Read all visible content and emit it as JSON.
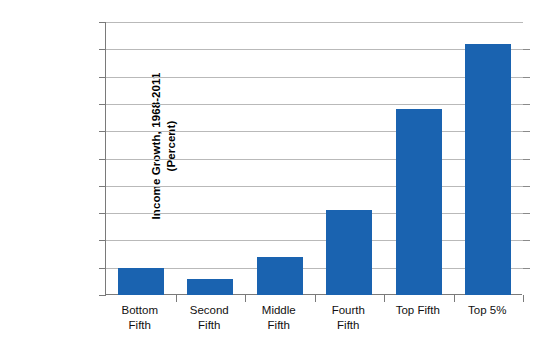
{
  "chart_data": {
    "type": "bar",
    "title": "",
    "subtitle": "",
    "xlabel": "",
    "ylabel": "Income Growth, 1968-2011 (Percent)",
    "ylabel_lines": [
      "Income Growth, 1968-2011",
      "(Percent)"
    ],
    "categories": [
      "Bottom Fifth",
      "Second Fifth",
      "Middle Fifth",
      "Fourth Fifth",
      "Top Fifth",
      "Top 5%"
    ],
    "category_lines": [
      [
        "Bottom",
        "Fifth"
      ],
      [
        "Second",
        "Fifth"
      ],
      [
        "Middle",
        "Fifth"
      ],
      [
        "Fourth",
        "Fifth"
      ],
      [
        "Top Fifth",
        ""
      ],
      [
        "Top 5%",
        ""
      ]
    ],
    "values": [
      10,
      6,
      14,
      31,
      68,
      92
    ],
    "ylim": [
      0,
      100
    ],
    "ytick_values": [
      0,
      10,
      20,
      30,
      40,
      50,
      60,
      70,
      80,
      90,
      100
    ],
    "ytick_labels": [
      "0",
      "10",
      "20",
      "30",
      "40",
      "50",
      "60",
      "70",
      "80",
      "90",
      "100"
    ],
    "grid": true,
    "legend": "none",
    "bar_color": "#1A63B0",
    "gridline_color": "#B9B9B9",
    "axis_color": "#7A7A7A"
  }
}
